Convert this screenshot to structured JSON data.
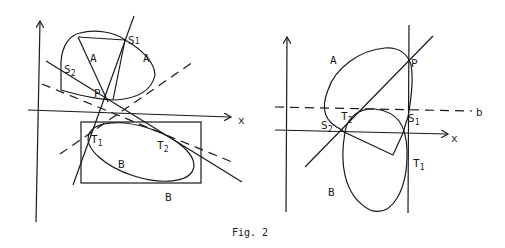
{
  "caption": "Fig. 2",
  "left_panel": {
    "axis_x_label": "x",
    "labels": {
      "A_inner": "A",
      "A_outer": "A",
      "S1": "S",
      "S1_sub": "1",
      "S2": "S",
      "S2_sub": "2",
      "P": "P",
      "T1": "T",
      "T1_sub": "1",
      "T2": "T",
      "T2_sub": "2",
      "B_inner": "B",
      "B_outer": "B"
    }
  },
  "right_panel": {
    "axis_x_label": "x",
    "labels": {
      "A": "A",
      "P": "P",
      "b": "b",
      "S1": "S",
      "S1_sub": "1",
      "S2": "S",
      "S2_sub": "2",
      "T1": "T",
      "T1_sub": "1",
      "T2": "T",
      "T2_sub": "2",
      "B": "B"
    }
  },
  "colors": {
    "ink": "#1a1a1a",
    "background": "#ffffff"
  }
}
